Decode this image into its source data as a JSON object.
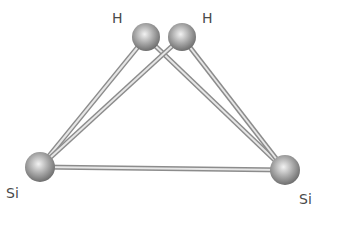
{
  "diagram": {
    "atoms": [
      {
        "id": "H1",
        "element": "H",
        "label": "H",
        "cx": 146,
        "cy": 37,
        "r": 14,
        "label_x": 112,
        "label_y": 11
      },
      {
        "id": "H2",
        "element": "H",
        "label": "H",
        "cx": 182,
        "cy": 37,
        "r": 14,
        "label_x": 202,
        "label_y": 11
      },
      {
        "id": "Si1",
        "element": "Si",
        "label": "Si",
        "cx": 40,
        "cy": 167,
        "r": 15,
        "label_x": 6,
        "label_y": 186
      },
      {
        "id": "Si2",
        "element": "Si",
        "label": "Si",
        "cx": 285,
        "cy": 170,
        "r": 15,
        "label_x": 299,
        "label_y": 192
      }
    ],
    "bonds": [
      {
        "from": "H1",
        "to": "Si1"
      },
      {
        "from": "H1",
        "to": "Si2"
      },
      {
        "from": "H2",
        "to": "Si1"
      },
      {
        "from": "H2",
        "to": "Si2"
      },
      {
        "from": "Si1",
        "to": "Si2"
      }
    ],
    "colors": {
      "atom_light": "#f2f2f2",
      "atom_mid": "#a8a8a8",
      "atom_dark": "#6e6e6e",
      "bond_outline": "#8c8c8c",
      "bond_fill": "#e6e6e6",
      "label": "#4a4a4a"
    }
  }
}
